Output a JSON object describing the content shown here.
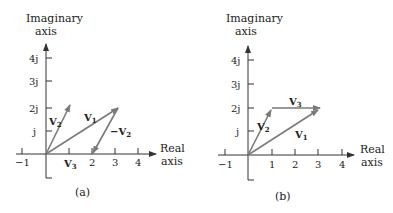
{
  "panels": [
    {
      "id": "a",
      "caption": "(a)",
      "y_axis_label_line1": "Imaginary",
      "y_axis_label_line2": "axis",
      "x_axis_label_line1": "Real",
      "x_axis_label_line2": "axis",
      "x_ticks": [
        "−1",
        "2",
        "3",
        "4"
      ],
      "y_ticks": [
        "4j",
        "3j",
        "2j",
        "j"
      ],
      "vectors": [
        {
          "name": "V1",
          "label": "V",
          "sub": "1",
          "from": [
            0,
            0
          ],
          "to": [
            3.2,
            2
          ]
        },
        {
          "name": "V2",
          "label": "V",
          "sub": "2",
          "from": [
            0,
            0
          ],
          "to": [
            1.2,
            2.2
          ]
        },
        {
          "name": "-V2",
          "label": "−V",
          "sub": "2",
          "from": [
            3.2,
            2
          ],
          "to": [
            2,
            0
          ]
        },
        {
          "name": "V3",
          "label": "V",
          "sub": "3",
          "from": [
            0,
            0
          ],
          "to": [
            2,
            0
          ]
        }
      ]
    },
    {
      "id": "b",
      "caption": "(b)",
      "y_axis_label_line1": "Imaginary",
      "y_axis_label_line2": "axis",
      "x_axis_label_line1": "Real",
      "x_axis_label_line2": "axis",
      "x_ticks": [
        "−1",
        "1",
        "2",
        "3",
        "4"
      ],
      "y_ticks": [
        "4j",
        "3j",
        "2j",
        "j"
      ],
      "vectors": [
        {
          "name": "V1",
          "label": "V",
          "sub": "1",
          "from": [
            0,
            0
          ],
          "to": [
            3,
            2
          ]
        },
        {
          "name": "V2",
          "label": "V",
          "sub": "2",
          "from": [
            0,
            0
          ],
          "to": [
            1,
            2
          ]
        },
        {
          "name": "V3",
          "label": "V",
          "sub": "3",
          "from": [
            1,
            2
          ],
          "to": [
            3,
            2
          ]
        }
      ]
    }
  ],
  "colors": {
    "axis": "#333333",
    "vector": "#7a7a7a",
    "text": "#222222"
  }
}
